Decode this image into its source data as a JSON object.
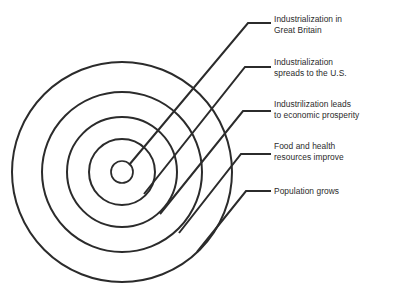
{
  "diagram": {
    "type": "concentric-circles-callout",
    "title_text": "",
    "stroke_color": "#2b2b2b",
    "text_color": "#2b2b2b",
    "background_color": "#ffffff",
    "center": {
      "x": 122,
      "y": 172
    },
    "rings": [
      {
        "index": 1,
        "name": "ring-innermost",
        "radius": 11
      },
      {
        "index": 2,
        "name": "ring-2",
        "radius": 33
      },
      {
        "index": 3,
        "name": "ring-3",
        "radius": 55
      },
      {
        "index": 4,
        "name": "ring-4",
        "radius": 80
      },
      {
        "index": 5,
        "name": "ring-outermost",
        "radius": 110
      }
    ],
    "callouts": [
      {
        "id": "callout-1",
        "ring_index": 1,
        "label": "Industrialization in\nGreat Britain",
        "label_x": 274,
        "label_y": 14,
        "leader": {
          "start_x": 129,
          "start_y": 165,
          "bend_x": 248,
          "bend_y": 23,
          "end_x": 271,
          "end_y": 23
        }
      },
      {
        "id": "callout-2",
        "ring_index": 2,
        "label": "Industrialization\nspreads to the U.S.",
        "label_x": 274,
        "label_y": 57,
        "leader": {
          "start_x": 144,
          "start_y": 194,
          "bend_x": 245,
          "bend_y": 67,
          "end_x": 271,
          "end_y": 67
        }
      },
      {
        "id": "callout-3",
        "ring_index": 3,
        "label": "Industrilization leads\nto economic prosperity",
        "label_x": 274,
        "label_y": 99,
        "leader": {
          "start_x": 160,
          "start_y": 214,
          "bend_x": 243,
          "bend_y": 111,
          "end_x": 271,
          "end_y": 111
        }
      },
      {
        "id": "callout-4",
        "ring_index": 4,
        "label": "Food and health\nresources improve",
        "label_x": 274,
        "label_y": 141,
        "leader": {
          "start_x": 179,
          "start_y": 233,
          "bend_x": 241,
          "bend_y": 154,
          "end_x": 271,
          "end_y": 154
        }
      },
      {
        "id": "callout-5",
        "ring_index": 5,
        "label": "Population grows",
        "label_x": 274,
        "label_y": 186,
        "leader": {
          "start_x": 197,
          "start_y": 252,
          "bend_x": 246,
          "bend_y": 191,
          "end_x": 271,
          "end_y": 191
        }
      }
    ]
  }
}
